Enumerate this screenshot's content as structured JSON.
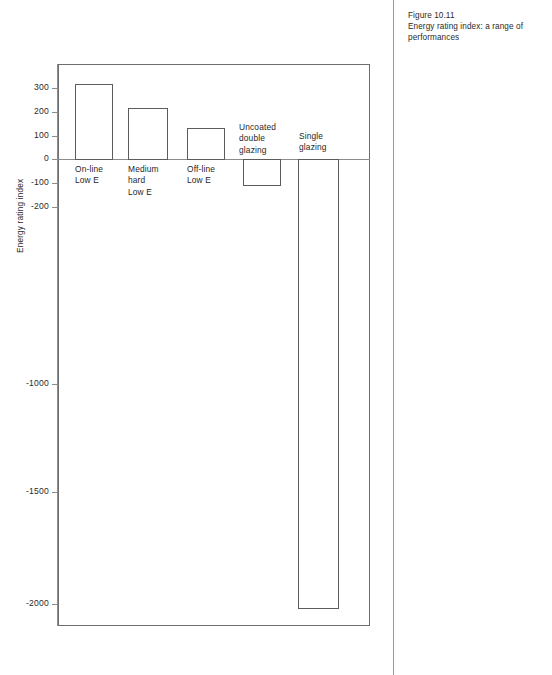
{
  "caption": {
    "figure_number": "Figure 10.11",
    "text": "Energy rating index: a range of\nperformances"
  },
  "chart_data": {
    "type": "bar",
    "title": "",
    "subtitle": "",
    "xlabel": "",
    "ylabel": "Energy rating index",
    "categories": [
      "On-line\nLow E",
      "Medium\nhard\nLow E",
      "Off-line\nLow E",
      "Uncoated\ndouble\nglazing",
      "Single\nglazing"
    ],
    "values": [
      320,
      215,
      130,
      -110,
      -2020
    ],
    "ylim": [
      -2100,
      380
    ],
    "yticks": [
      300,
      200,
      100,
      0,
      -100,
      -200,
      -1000,
      -1500,
      -2000
    ],
    "ytick_labels": [
      "300",
      "200",
      "100",
      "0",
      "-100",
      "-200",
      "-1000",
      "-1500",
      "-2000"
    ],
    "grid": false,
    "legend": false,
    "bar_face_color": "#ffffff",
    "bar_edge_color": "#5c5c5c",
    "axis_color": "#8c8c8c",
    "frame": true
  },
  "bars": [
    {
      "name": "on-line-low-e",
      "label": "On-line\nLow E",
      "value": 320,
      "x": 75,
      "width": 38,
      "top": 84,
      "height": 76,
      "label_x": 75,
      "label_y": 164
    },
    {
      "name": "medium-hard-low-e",
      "label": "Medium\nhard\nLow E",
      "value": 215,
      "x": 128,
      "width": 40,
      "top": 108,
      "height": 52,
      "label_x": 128,
      "label_y": 164
    },
    {
      "name": "off-line-low-e",
      "label": "Off-line\nLow E",
      "value": 130,
      "x": 187,
      "width": 38,
      "top": 128,
      "height": 32,
      "label_x": 187,
      "label_y": 164
    },
    {
      "name": "uncoated-double-glazing",
      "label": "Uncoated\ndouble\nglazing",
      "value": -110,
      "x": 243,
      "width": 38,
      "top": 159,
      "height": 27,
      "label_x": 239,
      "label_y": 122
    },
    {
      "name": "single-glazing",
      "label": "Single\nglazing",
      "value": -2020,
      "x": 298,
      "width": 41,
      "top": 159,
      "height": 450,
      "label_x": 299,
      "label_y": 131
    }
  ],
  "yticks": [
    {
      "label": "300",
      "top": 88
    },
    {
      "label": "200",
      "top": 112
    },
    {
      "label": "100",
      "top": 136
    },
    {
      "label": "0",
      "top": 159
    },
    {
      "label": "-100",
      "top": 183
    },
    {
      "label": "-200",
      "top": 207
    },
    {
      "label": "-1000",
      "top": 384
    },
    {
      "label": "-1500",
      "top": 492
    },
    {
      "label": "-2000",
      "top": 604
    }
  ]
}
